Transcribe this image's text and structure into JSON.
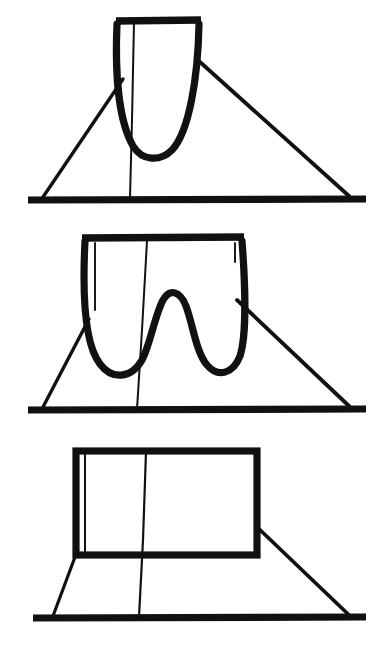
{
  "figure": {
    "background_color": "#ffffff",
    "ink_color": "#111111",
    "width": 390,
    "height": 655,
    "stroke_widths": {
      "thick": 7.0,
      "medium": 3.2,
      "thin": 2.0
    },
    "panels": [
      {
        "id": "panel-1",
        "index": 1,
        "name": "single-well-u-curve",
        "caption": "",
        "description": "Narrow U shaped (single well) vertical sheet rising from a triangular ground plane, capped by a thick horizontal top bar.",
        "baseline": {
          "x1": 28,
          "y1": 200,
          "x2": 365,
          "y2": 200
        },
        "triangle": {
          "left_foot": {
            "x": 43,
            "y": 198
          },
          "left_apex": {
            "x": 122,
            "y": 80
          },
          "right_apex": {
            "x": 200,
            "y": 62
          },
          "right_foot": {
            "x": 348,
            "y": 197
          }
        },
        "center_line": {
          "x1": 134,
          "y1": 22,
          "x2": 130,
          "y2": 198
        },
        "top_bar": {
          "x1": 116,
          "y1": 20,
          "x2": 200,
          "y2": 20
        },
        "curve_type": "single-well",
        "curve_min_y": 150,
        "curve_left_x": 116,
        "curve_right_x": 200
      },
      {
        "id": "panel-2",
        "index": 2,
        "name": "double-well-w-curve",
        "caption": "",
        "description": "Wide W shaped (double well) vertical sheet with a central hump, rising from a triangular ground plane, capped by a thick horizontal top bar.",
        "baseline": {
          "x1": 28,
          "y1": 410,
          "x2": 365,
          "y2": 410
        },
        "triangle": {
          "left_foot": {
            "x": 43,
            "y": 408
          },
          "left_apex": {
            "x": 88,
            "y": 320
          },
          "right_apex": {
            "x": 237,
            "y": 300
          },
          "right_foot": {
            "x": 348,
            "y": 407
          }
        },
        "center_line": {
          "x1": 147,
          "y1": 240,
          "x2": 137,
          "y2": 408
        },
        "top_bar": {
          "x1": 82,
          "y1": 237,
          "x2": 243,
          "y2": 237
        },
        "curve_type": "double-well",
        "well_left_min_y": 355,
        "well_right_min_y": 350,
        "hump_peak_y": 295,
        "hump_peak_x": 163,
        "curve_left_x": 82,
        "curve_right_x": 243
      },
      {
        "id": "panel-3",
        "index": 3,
        "name": "flat-box-rectangle",
        "caption": "",
        "description": "Thick rectangular frame (flat / infinite square well) standing on a trapezoidal ground plane, with a thin inner vertical line near the left edge and a thin vertical line at centre.",
        "baseline": {
          "x1": 33,
          "y1": 618,
          "x2": 365,
          "y2": 618
        },
        "rectangle": {
          "x": 73,
          "y": 448,
          "width": 185,
          "height": 110
        },
        "inner_left_line": {
          "x1": 85,
          "y1": 455,
          "x2": 85,
          "y2": 553
        },
        "center_line": {
          "x1": 145,
          "y1": 452,
          "x2": 139,
          "y2": 616
        },
        "ground": {
          "left_foot": {
            "x": 52,
            "y": 616
          },
          "left_top": {
            "x": 76,
            "y": 558
          },
          "right_top": {
            "x": 258,
            "y": 527
          },
          "right_foot": {
            "x": 348,
            "y": 615
          }
        }
      }
    ]
  }
}
